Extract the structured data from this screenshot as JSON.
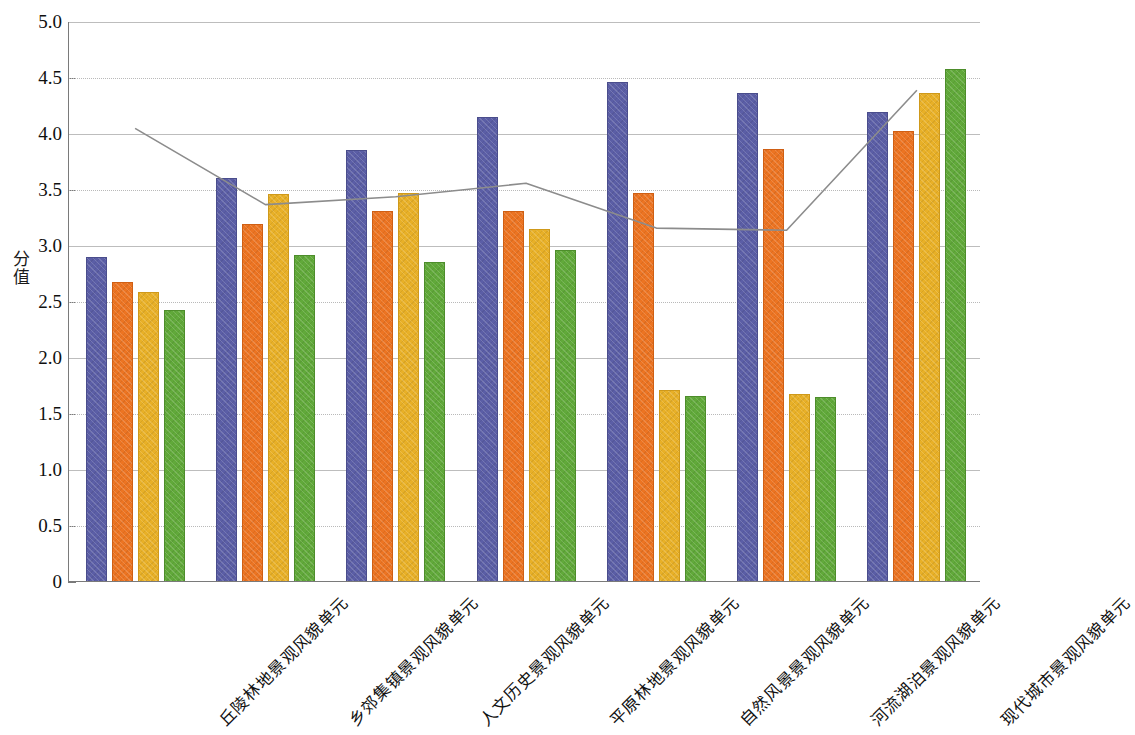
{
  "chart_data": {
    "type": "bar",
    "title": "",
    "xlabel": "",
    "ylabel": "分值",
    "ylim": [
      0,
      5.0
    ],
    "ytick_labels": [
      "5.0",
      "4.5",
      "4.0",
      "3.5",
      "3.0",
      "2.5",
      "2.0",
      "1.5",
      "1.0",
      "0.5",
      "0"
    ],
    "ytick_values": [
      5.0,
      4.5,
      4.0,
      3.5,
      3.0,
      2.5,
      2.0,
      1.5,
      1.0,
      0.5,
      0
    ],
    "grid": true,
    "legend": "none",
    "categories": [
      "丘陵林地景观风貌单元",
      "乡郊集镇景观风貌单元",
      "人文历史景观风貌单元",
      "平原林地景观风貌单元",
      "自然风景景观风貌单元",
      "河流湖泊景观风貌单元",
      "现代城市景观风貌单元"
    ],
    "series": [
      {
        "name": "series-1",
        "color": "#5b5ea6",
        "values": [
          2.9,
          3.61,
          3.86,
          4.15,
          4.46,
          4.37,
          4.2
        ]
      },
      {
        "name": "series-2",
        "color": "#ec7422",
        "values": [
          2.68,
          3.2,
          3.31,
          3.31,
          3.47,
          3.87,
          4.03
        ]
      },
      {
        "name": "series-3",
        "color": "#e8b027",
        "values": [
          2.59,
          3.46,
          3.47,
          3.15,
          1.71,
          1.68,
          4.37
        ]
      },
      {
        "name": "series-4",
        "color": "#61a93a",
        "values": [
          2.43,
          2.92,
          2.86,
          2.96,
          1.66,
          1.65,
          4.58
        ]
      }
    ],
    "line_series": {
      "name": "trend-line",
      "color": "#8c8c8c",
      "values": [
        4.05,
        3.37,
        3.44,
        3.56,
        3.16,
        3.14,
        4.39
      ]
    }
  }
}
